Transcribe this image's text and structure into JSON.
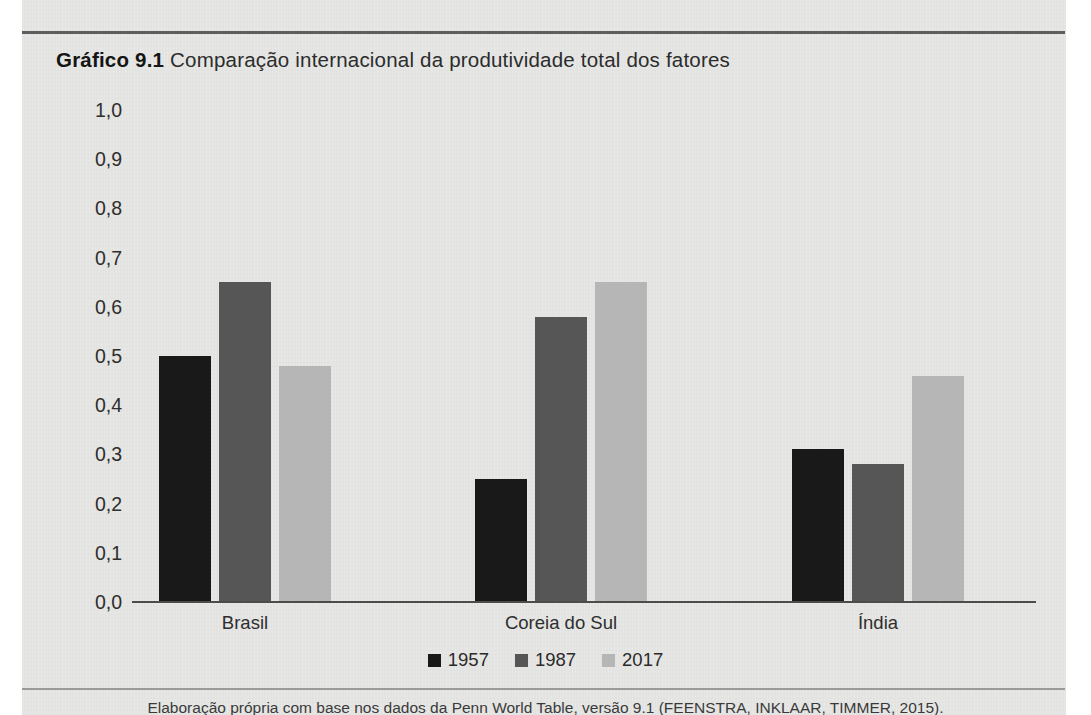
{
  "figure": {
    "label": "Gráfico 9.1",
    "title": "Comparação internacional da produtividade total dos fatores",
    "source": "Elaboração própria com base nos dados da Penn World Table, versão 9.1 (FEENSTRA, INKLAAR, TIMMER, 2015)."
  },
  "colors": {
    "series_1957": "#191919",
    "series_1987": "#565656",
    "series_2017": "#b6b6b6",
    "axis": "#4c4c4c",
    "paper": "#e8e8e6",
    "text": "#2e2e2e"
  },
  "chart_data": {
    "type": "bar",
    "title": "Gráfico 9.1 Comparação internacional da produtividade total dos fatores",
    "xlabel": "",
    "ylabel": "",
    "categories": [
      "Brasil",
      "Coreia do Sul",
      "Índia"
    ],
    "series": [
      {
        "name": "1957",
        "color": "#191919",
        "values": [
          0.5,
          0.25,
          0.31
        ]
      },
      {
        "name": "1987",
        "color": "#565656",
        "values": [
          0.65,
          0.58,
          0.28
        ]
      },
      {
        "name": "2017",
        "color": "#b6b6b6",
        "values": [
          0.48,
          0.65,
          0.46
        ]
      }
    ],
    "ylim": [
      0.0,
      1.0
    ],
    "ytick_values": [
      1.0,
      0.9,
      0.8,
      0.7,
      0.6,
      0.5,
      0.4,
      0.3,
      0.2,
      0.1,
      0.0
    ],
    "ytick_labels": [
      "1,0",
      "0,9",
      "0,8",
      "0,7",
      "0,6",
      "0,5",
      "0,4",
      "0,3",
      "0,2",
      "0,1",
      "0,0"
    ],
    "grid": false,
    "legend_position": "bottom",
    "decimal_separator": ","
  },
  "layout": {
    "baseline_y": 602,
    "top_y": 110,
    "plot_left": 132,
    "plot_right": 1036,
    "bar_width": 52,
    "bar_gap": 8,
    "group_centers": [
      245,
      561,
      878
    ]
  }
}
